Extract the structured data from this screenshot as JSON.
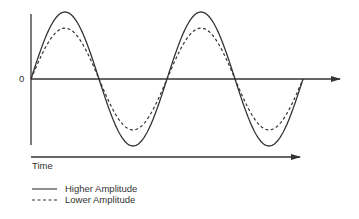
{
  "diagram": {
    "title": "",
    "y_axis_zero_label": "0",
    "x_axis_label": "Time",
    "colors": {
      "line": "#333333",
      "background": "#ffffff"
    }
  },
  "legend": {
    "items": [
      {
        "label": "Higher Amplitude",
        "style": "solid"
      },
      {
        "label": "Lower Amplitude",
        "style": "dashed"
      }
    ]
  },
  "chart_data": {
    "type": "line",
    "title": "",
    "xlabel": "Time",
    "ylabel": "",
    "y_tick_labels": [
      "0"
    ],
    "cycles": 2,
    "series": [
      {
        "name": "Higher Amplitude",
        "style": "solid",
        "amplitude": 1.0
      },
      {
        "name": "Lower Amplitude",
        "style": "dashed",
        "amplitude": 0.76
      }
    ],
    "legend_position": "bottom-left",
    "grid": false
  }
}
